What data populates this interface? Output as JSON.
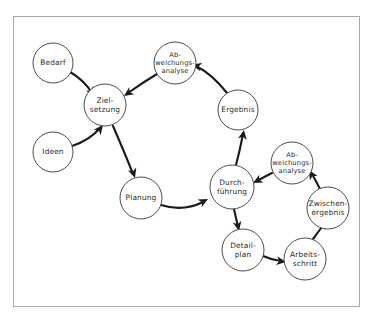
{
  "diagram": {
    "type": "cycle-flow-diagram",
    "frame": {
      "border_color": "#a9a9a9",
      "background_color": "#ffffff"
    },
    "style": {
      "node_fill": "#ffffff",
      "node_stroke": "#4d4d4d",
      "edge_color": "#1a1a1a",
      "label_color": "#2b2b2b"
    },
    "nodes": [
      {
        "id": "bedarf",
        "label": "Bedarf",
        "lines": [
          "Bedarf"
        ],
        "cx": 53,
        "cy": 63,
        "r": 20
      },
      {
        "id": "ideen",
        "label": "Ideen",
        "lines": [
          "Ideen"
        ],
        "cx": 53,
        "cy": 152,
        "r": 20
      },
      {
        "id": "zielsetzung",
        "label": "Zielsetzung",
        "lines": [
          "Ziel-",
          "setzung"
        ],
        "cx": 105,
        "cy": 105,
        "r": 21
      },
      {
        "id": "abweichungsanalyse1",
        "label": "Abweichungsanalyse",
        "lines": [
          "Ab-",
          "weichungs-",
          "analyse"
        ],
        "cx": 175,
        "cy": 63,
        "r": 21
      },
      {
        "id": "ergebnis",
        "label": "Ergebnis",
        "lines": [
          "Ergebnis"
        ],
        "cx": 238,
        "cy": 110,
        "r": 20
      },
      {
        "id": "planung",
        "label": "Planung",
        "lines": [
          "Planung"
        ],
        "cx": 141,
        "cy": 198,
        "r": 21
      },
      {
        "id": "durchfuehrung",
        "label": "Durchführung",
        "lines": [
          "Durch-",
          "führung"
        ],
        "cx": 232,
        "cy": 187,
        "r": 22
      },
      {
        "id": "abweichungsanalyse2",
        "label": "Abweichungsanalyse",
        "lines": [
          "Ab-",
          "weichungs-",
          "analyse"
        ],
        "cx": 292,
        "cy": 163,
        "r": 21
      },
      {
        "id": "zwischenergebnis",
        "label": "Zwischenergebnis",
        "lines": [
          "Zwischen-",
          "ergebnis"
        ],
        "cx": 328,
        "cy": 208,
        "r": 21
      },
      {
        "id": "detailplan",
        "label": "Detailplan",
        "lines": [
          "Detail-",
          "plan"
        ],
        "cx": 243,
        "cy": 250,
        "r": 21
      },
      {
        "id": "arbeitsschritt",
        "label": "Arbeitsschritt",
        "lines": [
          "Arbeits-",
          "schritt"
        ],
        "cx": 305,
        "cy": 259,
        "r": 21
      }
    ],
    "edges": [
      {
        "id": "e1",
        "from": "bedarf",
        "to": "zielsetzung",
        "path": "M 70 72 Q 84 80 92 93",
        "arrow": {
          "x": 95,
          "y": 96,
          "angle": 55
        }
      },
      {
        "id": "e2",
        "from": "ideen",
        "to": "zielsetzung",
        "path": "M 72 146 Q 90 140 100 128",
        "arrow": {
          "x": 103,
          "y": 125,
          "angle": -52
        }
      },
      {
        "id": "e3",
        "from": "abweichungsanalyse1",
        "to": "zielsetzung",
        "path": "M 157 74 Q 142 83 128 93",
        "arrow": {
          "x": 124,
          "y": 96,
          "angle": 145
        }
      },
      {
        "id": "e4",
        "from": "zielsetzung",
        "to": "planung",
        "path": "M 113 126 Q 126 156 133 174",
        "arrow": {
          "x": 135,
          "y": 178,
          "angle": 72
        }
      },
      {
        "id": "e5",
        "from": "planung",
        "to": "durchfuehrung",
        "path": "M 161 205 Q 183 212 203 202",
        "arrow": {
          "x": 208,
          "y": 199,
          "angle": -28
        }
      },
      {
        "id": "e6",
        "from": "durchfuehrung",
        "to": "ergebnis",
        "path": "M 236 165 Q 240 150 243 134",
        "arrow": {
          "x": 244,
          "y": 130,
          "angle": -80
        }
      },
      {
        "id": "e7",
        "from": "ergebnis",
        "to": "abweichungsanalyse1",
        "path": "M 227 93 Q 212 74 196 66",
        "arrow": {
          "x": 192,
          "y": 65,
          "angle": 192
        }
      },
      {
        "id": "e8",
        "from": "durchfuehrung",
        "to": "detailplan",
        "path": "M 234 209 Q 236 218 238 227",
        "arrow": {
          "x": 239,
          "y": 231,
          "angle": 78
        }
      },
      {
        "id": "e9",
        "from": "detailplan",
        "to": "arbeitsschritt",
        "path": "M 263 256 Q 272 260 281 261",
        "arrow": {
          "x": 286,
          "y": 262,
          "angle": 8
        }
      },
      {
        "id": "e10",
        "from": "arbeitsschritt",
        "to": "zwischenergebnis",
        "path": "M 313 239 Q 319 231 324 224",
        "arrow": {
          "x": 327,
          "y": 220,
          "angle": -56
        }
      },
      {
        "id": "e11",
        "from": "zwischenergebnis",
        "to": "abweichungsanalyse2",
        "path": "M 320 189 Q 316 181 312 174",
        "arrow": {
          "x": 309,
          "y": 170,
          "angle": -120
        }
      },
      {
        "id": "e12",
        "from": "abweichungsanalyse2",
        "to": "durchfuehrung",
        "path": "M 272 173 Q 264 177 257 181",
        "arrow": {
          "x": 253,
          "y": 183,
          "angle": 152
        }
      }
    ]
  }
}
